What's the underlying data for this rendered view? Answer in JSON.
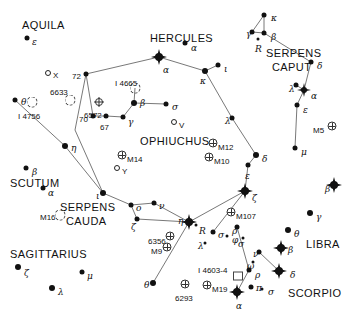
{
  "chart_data": {
    "type": "scatter",
    "xlabel": "",
    "ylabel": "",
    "xlim": [
      0,
      351
    ],
    "ylim": [
      0,
      310
    ],
    "grid": false,
    "legend": "none",
    "constellation_names": [
      {
        "name": "AQUILA",
        "x": 22,
        "y": 20
      },
      {
        "name": "HERCULES",
        "x": 150,
        "y": 33
      },
      {
        "name": "SERPENS",
        "x": 266,
        "y": 48
      },
      {
        "name": "CAPUT",
        "x": 272,
        "y": 62
      },
      {
        "name": "OPHIUCHUS",
        "x": 140,
        "y": 136
      },
      {
        "name": "SCUTUM",
        "x": 10,
        "y": 178
      },
      {
        "name": "SERPENS",
        "x": 60,
        "y": 202
      },
      {
        "name": "CAUDA",
        "x": 66,
        "y": 216
      },
      {
        "name": "SAGITTARIUS",
        "x": 10,
        "y": 249
      },
      {
        "name": "LIBRA",
        "x": 306,
        "y": 239
      },
      {
        "name": "SCORPIO",
        "x": 288,
        "y": 288
      }
    ],
    "stars": [
      {
        "label": "ε",
        "x": 27,
        "y": 38,
        "mag": 2,
        "lx": 32,
        "ly": 38
      },
      {
        "label": "α",
        "x": 185,
        "y": 43,
        "mag": 2,
        "lx": 191,
        "ly": 44
      },
      {
        "label": "θ",
        "x": 15,
        "y": 100,
        "mag": 2,
        "lx": 21,
        "ly": 98
      },
      {
        "label": "κ",
        "x": 264,
        "y": 15,
        "mag": 2,
        "lx": 271,
        "ly": 14
      },
      {
        "label": "γ",
        "x": 252,
        "y": 32,
        "mag": 2,
        "lx": 246,
        "ly": 30
      },
      {
        "label": "β",
        "x": 264,
        "y": 33,
        "mag": 2,
        "lx": 271,
        "ly": 33
      },
      {
        "label": "R",
        "x": 258,
        "y": 39,
        "mag": 0,
        "lx": 255,
        "ly": 45
      },
      {
        "label": "δ",
        "x": 311,
        "y": 62,
        "mag": 2,
        "lx": 317,
        "ly": 62
      },
      {
        "label": "λ",
        "x": 296,
        "y": 85,
        "mag": 2,
        "lx": 289,
        "ly": 85
      },
      {
        "label": "α",
        "x": 304,
        "y": 90,
        "mag": 4,
        "lx": 311,
        "ly": 92
      },
      {
        "label": "ε",
        "x": 297,
        "y": 105,
        "mag": 2,
        "lx": 303,
        "ly": 106
      },
      {
        "label": "μ",
        "x": 295,
        "y": 148,
        "mag": 2,
        "lx": 301,
        "ly": 148
      },
      {
        "label": "72",
        "x": 86,
        "y": 74,
        "mag": 2,
        "lx": 72,
        "ly": 73
      },
      {
        "label": "70",
        "x": 93,
        "y": 116,
        "mag": 2,
        "lx": 79,
        "ly": 116
      },
      {
        "label": "67",
        "x": 106,
        "y": 116,
        "mag": 2,
        "lx": 100,
        "ly": 124
      },
      {
        "label": "γ",
        "x": 123,
        "y": 117,
        "mag": 2,
        "lx": 128,
        "ly": 118
      },
      {
        "label": "β",
        "x": 134,
        "y": 103,
        "mag": 3,
        "lx": 140,
        "ly": 99
      },
      {
        "label": "α",
        "x": 159,
        "y": 57,
        "mag": 5,
        "lx": 163,
        "ly": 66
      },
      {
        "label": "κ",
        "x": 205,
        "y": 71,
        "mag": 3,
        "lx": 200,
        "ly": 77
      },
      {
        "label": "ι",
        "x": 218,
        "y": 65,
        "mag": 2,
        "lx": 224,
        "ly": 65
      },
      {
        "label": "σ",
        "x": 166,
        "y": 104,
        "mag": 2,
        "lx": 172,
        "ly": 103
      },
      {
        "label": "λ",
        "x": 232,
        "y": 118,
        "mag": 2,
        "lx": 225,
        "ly": 117
      },
      {
        "label": "δ",
        "x": 256,
        "y": 155,
        "mag": 3,
        "lx": 262,
        "ly": 155
      },
      {
        "label": "ε",
        "x": 248,
        "y": 165,
        "mag": 2,
        "lx": 245,
        "ly": 172
      },
      {
        "label": "ζ",
        "x": 245,
        "y": 191,
        "mag": 5,
        "lx": 252,
        "ly": 194
      },
      {
        "label": "η",
        "x": 65,
        "y": 146,
        "mag": 3,
        "lx": 71,
        "ly": 144
      },
      {
        "label": "β",
        "x": 26,
        "y": 168,
        "mag": 2,
        "lx": 32,
        "ly": 168
      },
      {
        "label": "α",
        "x": 43,
        "y": 188,
        "mag": 2,
        "lx": 48,
        "ly": 189
      },
      {
        "label": "ι",
        "x": 103,
        "y": 193,
        "mag": 3,
        "lx": 96,
        "ly": 192
      },
      {
        "label": "ο",
        "x": 131,
        "y": 205,
        "mag": 2,
        "lx": 136,
        "ly": 204
      },
      {
        "label": "ζ",
        "x": 137,
        "y": 219,
        "mag": 2,
        "lx": 131,
        "ly": 223
      },
      {
        "label": "ν",
        "x": 154,
        "y": 203,
        "mag": 2,
        "lx": 159,
        "ly": 202
      },
      {
        "label": "η",
        "x": 189,
        "y": 222,
        "mag": 5,
        "lx": 178,
        "ly": 217
      },
      {
        "label": "R",
        "x": 196,
        "y": 225,
        "mag": 0,
        "lx": 199,
        "ly": 227
      },
      {
        "label": "θ",
        "x": 153,
        "y": 283,
        "mag": 3,
        "lx": 144,
        "ly": 281
      },
      {
        "label": "ζ",
        "x": 18,
        "y": 267,
        "mag": 3,
        "lx": 24,
        "ly": 269
      },
      {
        "label": "μ",
        "x": 82,
        "y": 272,
        "mag": 2,
        "lx": 87,
        "ly": 272
      },
      {
        "label": "λ",
        "x": 52,
        "y": 288,
        "mag": 3,
        "lx": 58,
        "ly": 288
      },
      {
        "label": "σ",
        "x": 213,
        "y": 232,
        "mag": 2,
        "lx": 218,
        "ly": 231
      },
      {
        "label": "φ",
        "x": 227,
        "y": 236,
        "mag": 0,
        "lx": 232,
        "ly": 236
      },
      {
        "label": "λ",
        "x": 205,
        "y": 243,
        "mag": 0,
        "lx": 198,
        "ly": 242
      },
      {
        "label": "β",
        "x": 334,
        "y": 185,
        "mag": 5,
        "lx": 325,
        "ly": 185
      },
      {
        "label": "γ",
        "x": 310,
        "y": 213,
        "mag": 3,
        "lx": 316,
        "ly": 213
      },
      {
        "label": "θ",
        "x": 288,
        "y": 230,
        "mag": 3,
        "lx": 294,
        "ly": 230
      },
      {
        "label": "ρ",
        "x": 237,
        "y": 227,
        "mag": 2,
        "lx": 232,
        "ly": 227
      },
      {
        "label": "σ",
        "x": 243,
        "y": 238,
        "mag": 0,
        "lx": 238,
        "ly": 240
      },
      {
        "label": "ν",
        "x": 259,
        "y": 252,
        "mag": 2,
        "lx": 253,
        "ly": 250
      },
      {
        "label": "β",
        "x": 281,
        "y": 248,
        "mag": 5,
        "lx": 288,
        "ly": 246
      },
      {
        "label": "ω",
        "x": 253,
        "y": 262,
        "mag": 0,
        "lx": 247,
        "ly": 262
      },
      {
        "label": "ρ",
        "x": 249,
        "y": 270,
        "mag": 2,
        "lx": 255,
        "ly": 271
      },
      {
        "label": "δ",
        "x": 279,
        "y": 271,
        "mag": 5,
        "lx": 290,
        "ly": 271
      },
      {
        "label": "π",
        "x": 251,
        "y": 287,
        "mag": 2,
        "lx": 256,
        "ly": 284
      },
      {
        "label": "σ",
        "x": 262,
        "y": 289,
        "mag": 0,
        "lx": 268,
        "ly": 288
      },
      {
        "label": "α",
        "x": 237,
        "y": 292,
        "mag": 5,
        "lx": 236,
        "ly": 302
      }
    ],
    "open_circle_stars": [
      {
        "label": "X",
        "x": 48,
        "y": 73,
        "lx": 53,
        "ly": 72
      },
      {
        "label": "V",
        "x": 174,
        "y": 122,
        "lx": 179,
        "ly": 122
      },
      {
        "label": "Y",
        "x": 117,
        "y": 168,
        "lx": 122,
        "ly": 168
      }
    ],
    "deep_sky": [
      {
        "label": "I 4756",
        "x": 32,
        "y": 102,
        "type": "open",
        "lx": 18,
        "ly": 113
      },
      {
        "label": "6633",
        "x": 70,
        "y": 100,
        "type": "open",
        "lx": 50,
        "ly": 89
      },
      {
        "label": "6572",
        "x": 99,
        "y": 102,
        "type": "planetary",
        "lx": 84,
        "ly": 112
      },
      {
        "label": "I 4665",
        "x": 135,
        "y": 88,
        "type": "open",
        "lx": 115,
        "ly": 80
      },
      {
        "label": "M5",
        "x": 332,
        "y": 126,
        "type": "globular",
        "lx": 313,
        "ly": 127
      },
      {
        "label": "M14",
        "x": 122,
        "y": 155,
        "type": "globular",
        "lx": 127,
        "ly": 156
      },
      {
        "label": "M12",
        "x": 213,
        "y": 143,
        "type": "globular",
        "lx": 218,
        "ly": 144
      },
      {
        "label": "M10",
        "x": 209,
        "y": 157,
        "type": "globular",
        "lx": 214,
        "ly": 158
      },
      {
        "label": "M107",
        "x": 231,
        "y": 212,
        "type": "globular",
        "lx": 236,
        "ly": 213
      },
      {
        "label": "M16",
        "x": 60,
        "y": 215,
        "type": "open",
        "lx": 40,
        "ly": 214
      },
      {
        "label": "6356",
        "x": 170,
        "y": 236,
        "type": "globular",
        "lx": 148,
        "ly": 238
      },
      {
        "label": "M9",
        "x": 167,
        "y": 247,
        "type": "globular",
        "lx": 151,
        "ly": 248
      },
      {
        "label": "6293",
        "x": 185,
        "y": 284,
        "type": "globular",
        "lx": 175,
        "ly": 295
      },
      {
        "label": "M19",
        "x": 207,
        "y": 285,
        "type": "globular",
        "lx": 212,
        "ly": 286
      },
      {
        "label": "I 4603-4",
        "x": 238,
        "y": 276,
        "type": "nebula",
        "lx": 198,
        "ly": 267
      }
    ],
    "lines": [
      [
        [
          86,
          74
        ],
        [
          159,
          57
        ]
      ],
      [
        [
          159,
          57
        ],
        [
          205,
          71
        ]
      ],
      [
        [
          205,
          71
        ],
        [
          218,
          65
        ]
      ],
      [
        [
          205,
          71
        ],
        [
          232,
          118
        ]
      ],
      [
        [
          232,
          118
        ],
        [
          256,
          155
        ]
      ],
      [
        [
          256,
          155
        ],
        [
          248,
          165
        ]
      ],
      [
        [
          248,
          165
        ],
        [
          245,
          191
        ]
      ],
      [
        [
          245,
          191
        ],
        [
          189,
          222
        ]
      ],
      [
        [
          189,
          222
        ],
        [
          153,
          283
        ]
      ],
      [
        [
          245,
          191
        ],
        [
          213,
          232
        ]
      ],
      [
        [
          86,
          74
        ],
        [
          93,
          116
        ]
      ],
      [
        [
          93,
          116
        ],
        [
          106,
          116
        ]
      ],
      [
        [
          106,
          116
        ],
        [
          123,
          117
        ]
      ],
      [
        [
          123,
          117
        ],
        [
          134,
          103
        ]
      ],
      [
        [
          134,
          103
        ],
        [
          166,
          104
        ]
      ],
      [
        [
          134,
          103
        ],
        [
          135,
          88
        ]
      ],
      [
        [
          15,
          100
        ],
        [
          65,
          146
        ]
      ],
      [
        [
          65,
          146
        ],
        [
          103,
          193
        ]
      ],
      [
        [
          103,
          193
        ],
        [
          131,
          205
        ]
      ],
      [
        [
          131,
          205
        ],
        [
          137,
          219
        ]
      ],
      [
        [
          137,
          219
        ],
        [
          189,
          222
        ]
      ],
      [
        [
          131,
          205
        ],
        [
          154,
          203
        ]
      ],
      [
        [
          154,
          203
        ],
        [
          189,
          222
        ]
      ],
      [
        [
          264,
          15
        ],
        [
          252,
          32
        ]
      ],
      [
        [
          264,
          15
        ],
        [
          264,
          33
        ]
      ],
      [
        [
          252,
          32
        ],
        [
          264,
          33
        ]
      ],
      [
        [
          264,
          33
        ],
        [
          311,
          62
        ]
      ],
      [
        [
          311,
          62
        ],
        [
          304,
          90
        ]
      ],
      [
        [
          304,
          90
        ],
        [
          296,
          85
        ]
      ],
      [
        [
          304,
          90
        ],
        [
          297,
          105
        ]
      ],
      [
        [
          297,
          105
        ],
        [
          295,
          148
        ]
      ],
      [
        [
          86,
          74
        ],
        [
          75,
          130
        ]
      ],
      [
        [
          75,
          130
        ],
        [
          103,
          193
        ]
      ],
      [
        [
          237,
          292
        ],
        [
          249,
          270
        ]
      ],
      [
        [
          249,
          270
        ],
        [
          237,
          227
        ]
      ],
      [
        [
          279,
          271
        ],
        [
          259,
          252
        ]
      ]
    ]
  }
}
